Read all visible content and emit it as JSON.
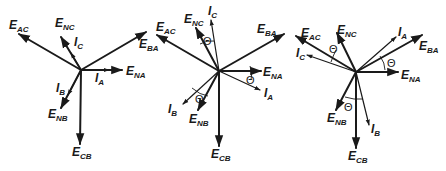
{
  "diagrams": [
    {
      "id": "phasor-unity",
      "origin": [
        81,
        70
      ],
      "labels": {
        "E_AC": {
          "main": "E",
          "sub": "AC"
        },
        "E_NC": {
          "main": "E",
          "sub": "NC"
        },
        "I_C": {
          "main": "I",
          "sub": "C"
        },
        "E_BA": {
          "main": "E",
          "sub": "BA"
        },
        "E_NA": {
          "main": "E",
          "sub": "NA"
        },
        "I_A": {
          "main": "I",
          "sub": "A"
        },
        "I_B": {
          "main": "I",
          "sub": "B"
        },
        "E_NB": {
          "main": "E",
          "sub": "NB"
        },
        "E_CB": {
          "main": "E",
          "sub": "CB"
        }
      }
    },
    {
      "id": "phasor-lagging",
      "origin": [
        219,
        71
      ],
      "theta": "Θ",
      "labels": {
        "E_AC": {
          "main": "E",
          "sub": "AC"
        },
        "E_NC": {
          "main": "E",
          "sub": "NC"
        },
        "I_C": {
          "main": "I",
          "sub": "C"
        },
        "E_BA": {
          "main": "E",
          "sub": "BA"
        },
        "E_NA": {
          "main": "E",
          "sub": "NA"
        },
        "I_A": {
          "main": "I",
          "sub": "A"
        },
        "I_B": {
          "main": "I",
          "sub": "B"
        },
        "E_NB": {
          "main": "E",
          "sub": "NB"
        },
        "E_CB": {
          "main": "E",
          "sub": "CB"
        }
      }
    },
    {
      "id": "phasor-leading",
      "origin": [
        356,
        72
      ],
      "theta": "Θ",
      "labels": {
        "E_AC": {
          "main": "E",
          "sub": "AC"
        },
        "E_NC": {
          "main": "E",
          "sub": "NC"
        },
        "I_C": {
          "main": "I",
          "sub": "C"
        },
        "E_BA": {
          "main": "E",
          "sub": "BA"
        },
        "E_NA": {
          "main": "E",
          "sub": "NA"
        },
        "I_A": {
          "main": "I",
          "sub": "A"
        },
        "I_B": {
          "main": "I",
          "sub": "B"
        },
        "E_NB": {
          "main": "E",
          "sub": "NB"
        },
        "E_CB": {
          "main": "E",
          "sub": "CB"
        }
      }
    }
  ]
}
